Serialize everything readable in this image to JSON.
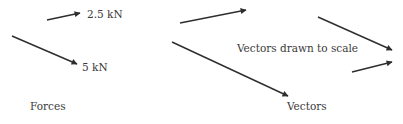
{
  "diagram": {
    "forces_panel": {
      "caption": "Forces",
      "arrows": [
        {
          "label": "2.5 kN",
          "x1": 47,
          "y1": 20,
          "x2": 80,
          "y2": 13
        },
        {
          "label": "5 kN",
          "x1": 12,
          "y1": 36,
          "x2": 77,
          "y2": 64
        }
      ]
    },
    "vectors_panel": {
      "caption": "Vectors",
      "annotation": "Vectors drawn to scale",
      "arrows": [
        {
          "x1": 180,
          "y1": 23,
          "x2": 246,
          "y2": 10
        },
        {
          "x1": 172,
          "y1": 42,
          "x2": 288,
          "y2": 96
        },
        {
          "x1": 318,
          "y1": 17,
          "x2": 392,
          "y2": 50
        },
        {
          "x1": 352,
          "y1": 72,
          "x2": 392,
          "y2": 62
        }
      ]
    },
    "colors": {
      "arrow": "#2e2e2e",
      "text": "#3a3a3a",
      "background": "#ffffff"
    }
  }
}
